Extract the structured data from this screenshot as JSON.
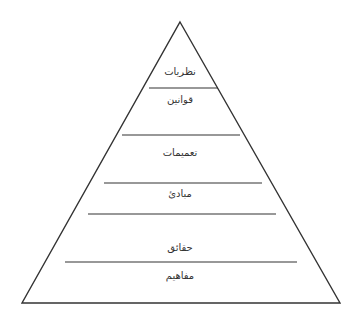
{
  "diagram": {
    "type": "pyramid",
    "stroke_color": "#333333",
    "background_color": "#ffffff",
    "levels_top_to_bottom": [
      {
        "label": "نظريات",
        "x": 180,
        "y": 72
      },
      {
        "label": "قوانين",
        "x": 180,
        "y": 100
      },
      {
        "label": "تعميمات",
        "x": 180,
        "y": 153
      },
      {
        "label": "مبادئ",
        "x": 180,
        "y": 194
      },
      {
        "label": "حقائق",
        "x": 180,
        "y": 248
      },
      {
        "label": "مفاهيم",
        "x": 180,
        "y": 276
      }
    ],
    "outline": {
      "apex": [
        180,
        22
      ],
      "base_left": [
        22,
        303
      ],
      "base_right": [
        340,
        303
      ]
    },
    "dividers": [
      {
        "y": 88,
        "x1": 149,
        "x2": 218
      },
      {
        "y": 135,
        "x1": 122,
        "x2": 240
      },
      {
        "y": 183,
        "x1": 104,
        "x2": 262
      },
      {
        "y": 214,
        "x1": 88,
        "x2": 276
      },
      {
        "y": 262,
        "x1": 65,
        "x2": 297
      }
    ]
  }
}
